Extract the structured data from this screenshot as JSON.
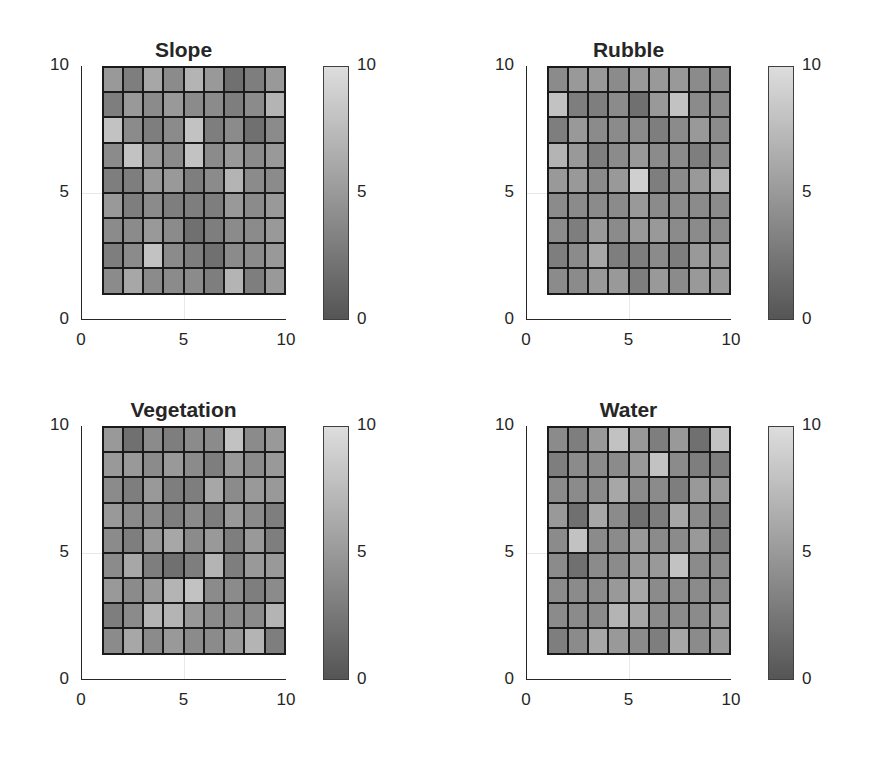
{
  "chart_data": [
    {
      "type": "heatmap",
      "title": "Slope",
      "xlabel": "",
      "ylabel": "",
      "xlim": [
        0,
        10
      ],
      "ylim": [
        0,
        10
      ],
      "xticks": [
        "0",
        "5",
        "10"
      ],
      "yticks": [
        "0",
        "5",
        "10"
      ],
      "colorbar": {
        "range": [
          0,
          10
        ],
        "ticks": [
          "0",
          "5",
          "10"
        ],
        "colormap": "gray (dark #555555 → light #dddddd)"
      },
      "grid_extent": {
        "x": [
          1,
          10
        ],
        "y": [
          1,
          10
        ]
      },
      "rows_top_to_bottom": [
        [
          5,
          3,
          6,
          4,
          7,
          5,
          2,
          3,
          5
        ],
        [
          3,
          5,
          4,
          5,
          4,
          4,
          3,
          4,
          7
        ],
        [
          8,
          4,
          3,
          4,
          8,
          3,
          4,
          2,
          4
        ],
        [
          4,
          8,
          5,
          4,
          8,
          4,
          5,
          4,
          5
        ],
        [
          3,
          3,
          5,
          5,
          3,
          4,
          7,
          4,
          4
        ],
        [
          5,
          3,
          4,
          3,
          3,
          3,
          5,
          4,
          5
        ],
        [
          4,
          4,
          5,
          4,
          2,
          3,
          4,
          4,
          5
        ],
        [
          3,
          4,
          8,
          4,
          3,
          2,
          4,
          4,
          5
        ],
        [
          4,
          6,
          4,
          4,
          4,
          3,
          7,
          3,
          5
        ]
      ]
    },
    {
      "type": "heatmap",
      "title": "Rubble",
      "xlabel": "",
      "ylabel": "",
      "xlim": [
        0,
        10
      ],
      "ylim": [
        0,
        10
      ],
      "xticks": [
        "0",
        "5",
        "10"
      ],
      "yticks": [
        "0",
        "5",
        "10"
      ],
      "colorbar": {
        "range": [
          0,
          10
        ],
        "ticks": [
          "0",
          "5",
          "10"
        ],
        "colormap": "gray (dark #555555 → light #dddddd)"
      },
      "grid_extent": {
        "x": [
          1,
          10
        ],
        "y": [
          1,
          10
        ]
      },
      "rows_top_to_bottom": [
        [
          4,
          5,
          5,
          4,
          5,
          5,
          5,
          4,
          4
        ],
        [
          8,
          3,
          3,
          4,
          2,
          5,
          8,
          4,
          4
        ],
        [
          3,
          5,
          4,
          4,
          4,
          3,
          4,
          5,
          4
        ],
        [
          7,
          5,
          3,
          4,
          5,
          4,
          4,
          3,
          4
        ],
        [
          5,
          5,
          4,
          5,
          9,
          3,
          4,
          5,
          7
        ],
        [
          4,
          4,
          4,
          4,
          5,
          4,
          4,
          4,
          4
        ],
        [
          4,
          3,
          5,
          4,
          5,
          5,
          4,
          4,
          4
        ],
        [
          3,
          4,
          6,
          3,
          3,
          4,
          3,
          5,
          5
        ],
        [
          4,
          4,
          5,
          5,
          3,
          5,
          4,
          5,
          5
        ]
      ]
    },
    {
      "type": "heatmap",
      "title": "Vegetation",
      "xlabel": "",
      "ylabel": "",
      "xlim": [
        0,
        10
      ],
      "ylim": [
        0,
        10
      ],
      "xticks": [
        "0",
        "5",
        "10"
      ],
      "yticks": [
        "0",
        "5",
        "10"
      ],
      "colorbar": {
        "range": [
          0,
          10
        ],
        "ticks": [
          "0",
          "5",
          "10"
        ],
        "colormap": "gray (dark #555555 → light #dddddd)"
      },
      "grid_extent": {
        "x": [
          1,
          10
        ],
        "y": [
          1,
          10
        ]
      },
      "rows_top_to_bottom": [
        [
          5,
          2,
          4,
          3,
          4,
          4,
          8,
          4,
          5
        ],
        [
          5,
          5,
          4,
          5,
          4,
          3,
          5,
          4,
          5
        ],
        [
          4,
          3,
          5,
          3,
          3,
          6,
          4,
          5,
          5
        ],
        [
          5,
          4,
          4,
          3,
          4,
          3,
          5,
          4,
          3
        ],
        [
          4,
          3,
          5,
          6,
          4,
          5,
          3,
          5,
          3
        ],
        [
          4,
          6,
          3,
          2,
          3,
          7,
          3,
          5,
          5
        ],
        [
          5,
          4,
          5,
          7,
          8,
          4,
          4,
          3,
          4
        ],
        [
          3,
          4,
          7,
          7,
          5,
          4,
          4,
          4,
          7
        ],
        [
          4,
          6,
          4,
          5,
          4,
          4,
          5,
          7,
          3
        ]
      ]
    },
    {
      "type": "heatmap",
      "title": "Water",
      "xlabel": "",
      "ylabel": "",
      "xlim": [
        0,
        10
      ],
      "ylim": [
        0,
        10
      ],
      "xticks": [
        "0",
        "5",
        "10"
      ],
      "yticks": [
        "0",
        "5",
        "10"
      ],
      "colorbar": {
        "range": [
          0,
          10
        ],
        "ticks": [
          "0",
          "5",
          "10"
        ],
        "colormap": "gray (dark #555555 → light #dddddd)"
      },
      "grid_extent": {
        "x": [
          1,
          10
        ],
        "y": [
          1,
          10
        ]
      },
      "rows_top_to_bottom": [
        [
          4,
          3,
          5,
          8,
          5,
          3,
          5,
          2,
          8
        ],
        [
          3,
          4,
          4,
          4,
          5,
          8,
          4,
          3,
          3
        ],
        [
          4,
          4,
          4,
          6,
          4,
          4,
          3,
          5,
          5
        ],
        [
          5,
          2,
          6,
          4,
          2,
          3,
          6,
          4,
          3
        ],
        [
          4,
          8,
          4,
          4,
          5,
          4,
          4,
          5,
          3
        ],
        [
          4,
          2,
          4,
          4,
          5,
          5,
          8,
          4,
          4
        ],
        [
          4,
          4,
          4,
          5,
          6,
          4,
          4,
          4,
          4
        ],
        [
          4,
          4,
          4,
          7,
          6,
          4,
          4,
          4,
          5
        ],
        [
          3,
          4,
          6,
          5,
          4,
          3,
          6,
          4,
          5
        ]
      ]
    }
  ]
}
